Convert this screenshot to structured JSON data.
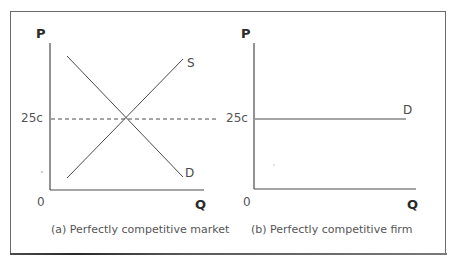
{
  "figure": {
    "panels": [
      {
        "id": "a",
        "caption": "(a) Perfectly competitive market",
        "y_axis_label": "P",
        "x_axis_label": "Q",
        "origin_label": "0",
        "price_tick_label": "25c",
        "curves": [
          {
            "name": "S",
            "label": "S",
            "type": "supply",
            "slope": "upward"
          },
          {
            "name": "D",
            "label": "D",
            "type": "demand",
            "slope": "downward"
          }
        ],
        "equilibrium_line": {
          "style": "dashed",
          "price": "25c"
        }
      },
      {
        "id": "b",
        "caption": "(b) Perfectly competitive firm",
        "y_axis_label": "P",
        "x_axis_label": "Q",
        "origin_label": "0",
        "price_tick_label": "25c",
        "curves": [
          {
            "name": "D",
            "label": "D",
            "type": "demand",
            "slope": "horizontal"
          }
        ]
      }
    ]
  },
  "colors": {
    "line": "#4a4a4a",
    "axis": "#4a4a4a",
    "frame": "#6a6a6a",
    "text": "#3a3a3a"
  }
}
